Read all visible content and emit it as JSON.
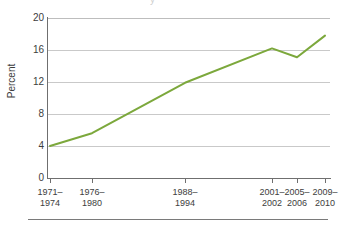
{
  "figure": {
    "scan_artifact_text": "y",
    "bottom_rule": "horizontal-rule"
  },
  "chart_data": {
    "type": "line",
    "title": "",
    "xlabel": "",
    "ylabel": "Percent",
    "ylim": [
      0,
      20
    ],
    "yticks": [
      0,
      4,
      8,
      12,
      16,
      20
    ],
    "ytick_labels": [
      "0",
      "4",
      "8",
      "12",
      "16",
      "20"
    ],
    "grid": true,
    "legend": "none",
    "categories": [
      "1971–1974",
      "1976–1980",
      "1988–1994",
      "2001–2002",
      "2005–2006",
      "2009–2010"
    ],
    "category_lines": [
      [
        "1971–",
        "1974"
      ],
      [
        "1976–",
        "1980"
      ],
      [
        "1988–",
        "1994"
      ],
      [
        "2001–",
        "2002"
      ],
      [
        "2005–",
        "2006"
      ],
      [
        "2009–",
        "2010"
      ]
    ],
    "values": [
      4.0,
      5.6,
      11.9,
      16.2,
      15.1,
      17.8
    ],
    "series": [
      {
        "name": "Percent",
        "color": "#7CA83C",
        "values": [
          4.0,
          5.6,
          11.9,
          16.2,
          15.1,
          17.8
        ]
      }
    ],
    "x_positions_px": [
      50,
      92,
      185,
      272,
      297,
      325
    ],
    "line_color": "#7CA83C",
    "line_width": 2
  }
}
